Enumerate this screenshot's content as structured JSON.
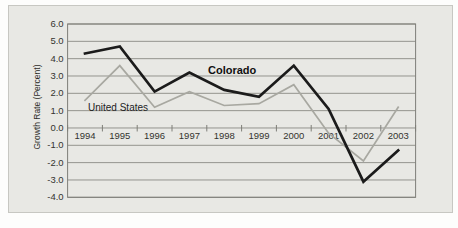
{
  "chart_data": {
    "type": "line",
    "title": "",
    "ylabel": "Growth Rate (Percent)",
    "xlabel": "",
    "categories": [
      "1994",
      "1995",
      "1996",
      "1997",
      "1998",
      "1999",
      "2000",
      "2001",
      "2002",
      "2003"
    ],
    "series": [
      {
        "name": "Colorado",
        "values": [
          4.3,
          4.7,
          2.1,
          3.2,
          2.2,
          1.8,
          3.6,
          1.1,
          -3.1,
          -1.3
        ],
        "color": "#1b1b1b",
        "stroke_width": 2.7,
        "label": {
          "text": "Colorado",
          "x": 208,
          "y": 74,
          "bold": true
        }
      },
      {
        "name": "United States",
        "values": [
          1.6,
          3.6,
          1.2,
          2.1,
          1.3,
          1.4,
          2.5,
          -0.3,
          -1.9,
          1.2
        ],
        "color": "#a8a8a1",
        "stroke_width": 1.7,
        "label": {
          "text": "United States",
          "x": 88,
          "y": 111,
          "bold": false
        }
      }
    ],
    "ylim": [
      -4,
      6
    ],
    "ytick_step": 1,
    "yticks": [
      "6.0",
      "5.0",
      "4.0",
      "3.0",
      "2.0",
      "1.0",
      "0.0",
      "-1.0",
      "-2.0",
      "-3.0",
      "-4.0"
    ],
    "grid": true,
    "legend_position": "inline-labels-on-lines",
    "colors": {
      "page_bg": "#fdfdfc",
      "panel_bg": "#e8e8e4",
      "panel_border": "#c7c7c2",
      "plot_border": "#7e7e78",
      "gridline": "#94948e",
      "tick_mark": "#7e7e78",
      "text": "#34342f"
    }
  }
}
